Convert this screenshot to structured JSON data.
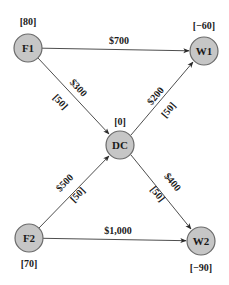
{
  "diagram": {
    "type": "network-flow",
    "nodes": [
      {
        "id": "F1",
        "label": "F1",
        "value": "[80]",
        "x": 28,
        "y": 48,
        "value_x": 28,
        "value_y": 25
      },
      {
        "id": "W1",
        "label": "W1",
        "value": "[−60]",
        "x": 204,
        "y": 51,
        "value_x": 204,
        "value_y": 29
      },
      {
        "id": "DC",
        "label": "DC",
        "value": "[0]",
        "x": 120,
        "y": 145,
        "value_x": 120,
        "value_y": 125
      },
      {
        "id": "F2",
        "label": "F2",
        "value": "[70]",
        "x": 29,
        "y": 238,
        "value_x": 29,
        "value_y": 267
      },
      {
        "id": "W2",
        "label": "W2",
        "value": "[−90]",
        "x": 201,
        "y": 241,
        "value_x": 201,
        "value_y": 271
      }
    ],
    "edges": [
      {
        "from": "F1",
        "to": "W1",
        "cost": "$700",
        "capacity": ""
      },
      {
        "from": "F1",
        "to": "DC",
        "cost": "$300",
        "capacity": "[50]"
      },
      {
        "from": "DC",
        "to": "W1",
        "cost": "$200",
        "capacity": "[50]"
      },
      {
        "from": "F2",
        "to": "DC",
        "cost": "$500",
        "capacity": "[50]"
      },
      {
        "from": "DC",
        "to": "W2",
        "cost": "$400",
        "capacity": "[50]"
      },
      {
        "from": "F2",
        "to": "W2",
        "cost": "$1,000",
        "capacity": ""
      }
    ],
    "colors": {
      "node_fill": "#c6c6c6",
      "node_stroke": "#6a6a6a",
      "edge": "#3a3a3a",
      "text": "#1a1a1a"
    }
  }
}
